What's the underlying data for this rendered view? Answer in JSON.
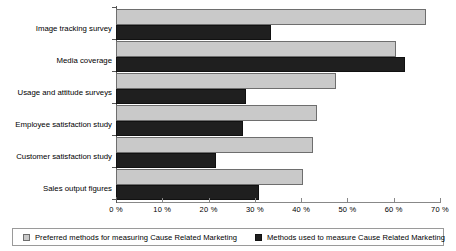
{
  "chart_data": {
    "type": "bar",
    "orientation": "horizontal",
    "title": "",
    "xlabel": "",
    "ylabel": "",
    "xlim": [
      0,
      70
    ],
    "xticks": [
      "0 %",
      "10 %",
      "20 %",
      "30 %",
      "40 %",
      "50 %",
      "60 %",
      "70 %"
    ],
    "xtick_values": [
      0,
      10,
      20,
      30,
      40,
      50,
      60,
      70
    ],
    "grid": false,
    "legend_position": "bottom",
    "categories": [
      "Image tracking survey",
      "Media coverage",
      "Usage and attitude surveys",
      "Employee satisfaction study",
      "Customer satisfaction study",
      "Sales output figures"
    ],
    "series": [
      {
        "name": "Preferred methods for measuring Cause Related Marketing",
        "color": "#c9c9c9",
        "values": [
          67,
          60.5,
          47.5,
          43.5,
          42.5,
          40.5
        ]
      },
      {
        "name": "Methods used to measure Cause Related Marketing",
        "color": "#1f1f1f",
        "values": [
          33.5,
          62.5,
          28,
          27.5,
          21.5,
          31
        ]
      }
    ]
  },
  "legend": {
    "items": [
      {
        "label": "Preferred methods for measuring Cause Related Marketing",
        "swatch": "light"
      },
      {
        "label": "Methods used to measure Cause Related Marketing",
        "swatch": "dark"
      }
    ]
  }
}
